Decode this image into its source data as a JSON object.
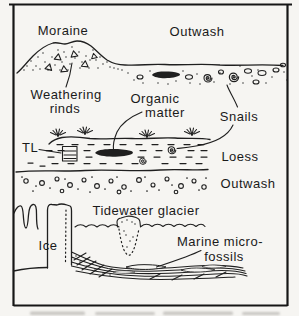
{
  "figure": {
    "labels": {
      "moraine": "Moraine",
      "outwash_top": "Outwash",
      "weathering_rinds_1": "Weathering",
      "weathering_rinds_2": "rinds",
      "organic_matter_1": "Organic",
      "organic_matter_2": "matter",
      "snails": "Snails",
      "tl": "TL",
      "loess": "Loess",
      "outwash_lower": "Outwash",
      "tidewater_glacier": "Tidewater glacier",
      "ice": "Ice",
      "marine_microfossils_1": "Marine micro-",
      "marine_microfossils_2": "fossils"
    },
    "colors": {
      "ink": "#1f1f1f",
      "paper": "#f6f5f2"
    }
  }
}
